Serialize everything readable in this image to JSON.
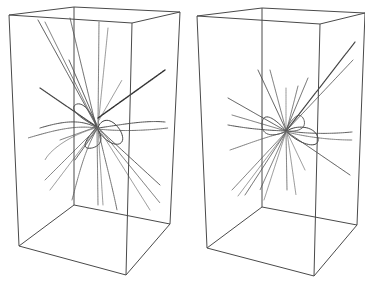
{
  "figure": {
    "width": 365,
    "height": 291,
    "background": "#ffffff",
    "edge_color": "#4a4a4a",
    "panels": [
      {
        "id": "left",
        "box": {
          "top": [
            [
              9,
              15
            ],
            [
              74,
              7
            ],
            [
              180,
              12
            ],
            [
              132,
              23
            ]
          ],
          "bottom": [
            [
              19,
              246
            ],
            [
              74,
              205
            ],
            [
              170,
              224
            ],
            [
              126,
              275
            ]
          ]
        },
        "center": [
          97,
          127
        ],
        "trajectories": [
          {
            "d": "M97,127 L38,20",
            "c": "#555",
            "w": 0.9
          },
          {
            "d": "M97,127 L45,22",
            "c": "#666",
            "w": 0.8
          },
          {
            "d": "M96,126 L70,18",
            "c": "#555",
            "w": 0.8
          },
          {
            "d": "M98,126 L99,22",
            "c": "#666",
            "w": 0.8
          },
          {
            "d": "M98,127 L108,28",
            "c": "#777",
            "w": 0.7
          },
          {
            "d": "M97,125 L69,60",
            "c": "#555",
            "w": 0.9
          },
          {
            "d": "M99,120 L122,80",
            "c": "#777",
            "w": 0.7
          },
          {
            "d": "M98,118 L165,70",
            "c": "#333",
            "w": 1.4
          },
          {
            "d": "M97,127 L40,88",
            "c": "#444",
            "w": 1.2
          },
          {
            "d": "M97,128 C80,118 60,122 40,128",
            "c": "#555",
            "w": 1.0
          },
          {
            "d": "M97,128 C75,125 55,130 28,138",
            "c": "#666",
            "w": 0.9
          },
          {
            "d": "M98,128 C120,125 145,120 165,122",
            "c": "#555",
            "w": 1.0
          },
          {
            "d": "M98,129 C125,132 150,130 168,128",
            "c": "#666",
            "w": 0.9
          },
          {
            "d": "M98,130 C110,150 130,148 120,130 C110,115 100,120 98,128",
            "c": "#444",
            "w": 1.0
          },
          {
            "d": "M96,128 C85,140 80,150 92,148 C104,145 102,135 97,128",
            "c": "#444",
            "w": 1.0
          },
          {
            "d": "M97,127 C80,118 70,110 75,105 C82,100 92,112 97,127",
            "c": "#555",
            "w": 1.0
          },
          {
            "d": "M97,128 L45,180",
            "c": "#666",
            "w": 0.8
          },
          {
            "d": "M97,128 L50,190",
            "c": "#777",
            "w": 0.7
          },
          {
            "d": "M97,129 L75,160",
            "c": "#555",
            "w": 0.9
          },
          {
            "d": "M97,129 C85,150 80,170 72,200",
            "c": "#666",
            "w": 0.8
          },
          {
            "d": "M97,129 L98,205",
            "c": "#666",
            "w": 0.8
          },
          {
            "d": "M98,129 L103,205",
            "c": "#777",
            "w": 0.7
          },
          {
            "d": "M98,129 C105,160 112,185 117,210",
            "c": "#555",
            "w": 0.8
          },
          {
            "d": "M99,129 L160,185",
            "c": "#555",
            "w": 0.9
          },
          {
            "d": "M99,128 L160,203",
            "c": "#666",
            "w": 0.8
          },
          {
            "d": "M99,129 L150,210",
            "c": "#777",
            "w": 0.7
          },
          {
            "d": "M96,127 L60,140",
            "c": "#666",
            "w": 0.8
          },
          {
            "d": "M96,128 C70,135 50,150 45,160",
            "c": "#777",
            "w": 0.7
          }
        ]
      },
      {
        "id": "right",
        "box": {
          "top": [
            [
              197,
              16
            ],
            [
              262,
              8
            ],
            [
              365,
              13
            ],
            [
              320,
              24
            ]
          ],
          "bottom": [
            [
              207,
              248
            ],
            [
              262,
              207
            ],
            [
              357,
              225
            ],
            [
              314,
              276
            ]
          ]
        },
        "center": [
          286,
          131
        ],
        "trajectories": [
          {
            "d": "M286,131 L355,42",
            "c": "#444",
            "w": 1.2
          },
          {
            "d": "M286,131 L353,60",
            "c": "#666",
            "w": 0.9
          },
          {
            "d": "M286,130 L258,70",
            "c": "#555",
            "w": 0.9
          },
          {
            "d": "M286,130 L270,70",
            "c": "#666",
            "w": 0.8
          },
          {
            "d": "M286,130 L286,88",
            "c": "#777",
            "w": 0.7
          },
          {
            "d": "M287,129 L298,86",
            "c": "#666",
            "w": 0.8
          },
          {
            "d": "M287,128 L308,78",
            "c": "#555",
            "w": 0.8
          },
          {
            "d": "M286,131 L228,98",
            "c": "#555",
            "w": 0.9
          },
          {
            "d": "M286,131 L232,115",
            "c": "#666",
            "w": 0.8
          },
          {
            "d": "M286,131 C260,130 245,128 228,125",
            "c": "#555",
            "w": 1.0
          },
          {
            "d": "M286,132 C262,138 245,145 230,150",
            "c": "#666",
            "w": 0.8
          },
          {
            "d": "M287,131 C310,134 330,134 352,132",
            "c": "#555",
            "w": 0.9
          },
          {
            "d": "M287,132 C310,138 335,140 352,140",
            "c": "#666",
            "w": 0.8
          },
          {
            "d": "M287,132 C300,145 320,150 318,138 C315,125 295,125 287,131",
            "c": "#444",
            "w": 1.0
          },
          {
            "d": "M286,131 C275,118 262,110 262,125 C262,138 278,136 286,131",
            "c": "#555",
            "w": 1.0
          },
          {
            "d": "M286,130 C292,118 300,110 304,120 C307,130 295,132 286,131",
            "c": "#555",
            "w": 0.9
          },
          {
            "d": "M286,132 L232,190",
            "c": "#666",
            "w": 0.8
          },
          {
            "d": "M286,132 L238,196",
            "c": "#777",
            "w": 0.7
          },
          {
            "d": "M286,132 L245,195",
            "c": "#555",
            "w": 0.8
          },
          {
            "d": "M286,132 L260,190",
            "c": "#666",
            "w": 0.8
          },
          {
            "d": "M286,132 L264,200",
            "c": "#777",
            "w": 0.7
          },
          {
            "d": "M286,132 L287,190",
            "c": "#666",
            "w": 0.8
          },
          {
            "d": "M287,132 L296,195",
            "c": "#777",
            "w": 0.7
          },
          {
            "d": "M287,132 L350,175",
            "c": "#555",
            "w": 0.9
          },
          {
            "d": "M287,132 L305,170",
            "c": "#777",
            "w": 0.7
          }
        ]
      }
    ]
  }
}
